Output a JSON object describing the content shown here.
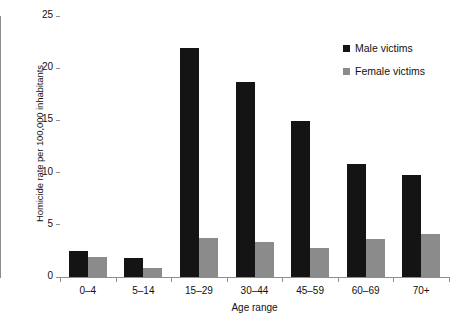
{
  "chart_data": {
    "type": "bar",
    "title": "",
    "xlabel": "Age range",
    "ylabel": "Homicide rate per 100,000 inhabitants",
    "categories": [
      "0–4",
      "5–14",
      "15–29",
      "30–44",
      "45–59",
      "60–69",
      "70+"
    ],
    "series": [
      {
        "name": "Male victims",
        "color": "#141414",
        "values": [
          2.5,
          1.8,
          21.9,
          18.7,
          14.9,
          10.8,
          9.8
        ]
      },
      {
        "name": "Female victims",
        "color": "#8b8b8b",
        "values": [
          1.9,
          0.9,
          3.7,
          3.4,
          2.8,
          3.6,
          4.1
        ]
      }
    ],
    "ylim": [
      0,
      25
    ],
    "yticks": [
      0,
      5,
      10,
      15,
      20,
      25
    ],
    "ytick_labels": [
      "0",
      "5",
      "10",
      "15",
      "20",
      "25"
    ],
    "grid": false,
    "legend_position": "top-right"
  },
  "axes": {
    "y_title": "Homicide rate per 100,000 inhabitants",
    "x_title": "Age range"
  },
  "legend": {
    "items": [
      {
        "label": "Male victims",
        "color": "#141414",
        "swatch": "square-marker-icon"
      },
      {
        "label": "Female victims",
        "color": "#8b8b8b",
        "swatch": "square-marker-icon"
      }
    ]
  }
}
